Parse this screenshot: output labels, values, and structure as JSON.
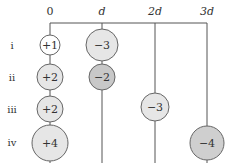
{
  "diagram": {
    "axis": {
      "ticks": [
        {
          "label": "0",
          "x": 50,
          "italic": false
        },
        {
          "label": "d",
          "x": 102,
          "italic": true
        },
        {
          "label": "2d",
          "x": 155,
          "italic": true
        },
        {
          "label": "3d",
          "x": 207,
          "italic": true
        }
      ]
    },
    "rows": [
      {
        "label": "i",
        "y": 45
      },
      {
        "label": "ii",
        "y": 77
      },
      {
        "label": "iii",
        "y": 109
      },
      {
        "label": "iv",
        "y": 142
      }
    ],
    "charges": [
      {
        "row": "i",
        "value": "+1",
        "x": 50,
        "y": 45,
        "r": 10,
        "fill": "#ffffff"
      },
      {
        "row": "i",
        "value": "−3",
        "x": 102,
        "y": 45,
        "r": 16,
        "fill": "#e6e6e6"
      },
      {
        "row": "ii",
        "value": "+2",
        "x": 50,
        "y": 77,
        "r": 13,
        "fill": "#e6e6e6"
      },
      {
        "row": "ii",
        "value": "−2",
        "x": 102,
        "y": 77,
        "r": 13,
        "fill": "#c8c8c8"
      },
      {
        "row": "iii",
        "value": "+2",
        "x": 50,
        "y": 109,
        "r": 13,
        "fill": "#e6e6e6"
      },
      {
        "row": "iii",
        "value": "−3",
        "x": 155,
        "y": 107,
        "r": 14,
        "fill": "#e6e6e6"
      },
      {
        "row": "iv",
        "value": "+4",
        "x": 50,
        "y": 143,
        "r": 18,
        "fill": "#e6e6e6"
      },
      {
        "row": "iv",
        "value": "−4",
        "x": 207,
        "y": 143,
        "r": 17,
        "fill": "#cfcfcf"
      }
    ],
    "colors": {
      "line": "#555555",
      "stroke": "#666666",
      "text": "#333333"
    }
  }
}
